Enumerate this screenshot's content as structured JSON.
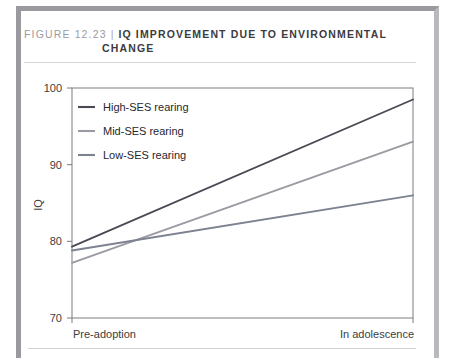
{
  "figure": {
    "number": "FIGURE 12.23",
    "separator": "|",
    "title_line1": "IQ IMPROVEMENT DUE TO ENVIRONMENTAL",
    "title_line2": "CHANGE"
  },
  "chart_data": {
    "type": "line",
    "title": "IQ IMPROVEMENT DUE TO ENVIRONMENTAL CHANGE",
    "xlabel": "",
    "ylabel": "IQ",
    "x": [
      "Pre-adoption",
      "In adolescence"
    ],
    "categories": [
      "Pre-adoption",
      "In adolescence"
    ],
    "xtick_labels": [
      "Pre-adoption",
      "In adolescence"
    ],
    "ytick_labels": [
      "100",
      "90",
      "80",
      "70"
    ],
    "yticks": [
      100,
      90,
      80,
      70
    ],
    "ylim": [
      70,
      100
    ],
    "grid": false,
    "legend_position": "upper-left-inside",
    "series": [
      {
        "name": "High-SES rearing",
        "values": [
          79.3,
          98.5
        ],
        "color": "#4a4a55"
      },
      {
        "name": "Mid-SES rearing",
        "values": [
          77.2,
          93.0
        ],
        "color": "#9a9aa2"
      },
      {
        "name": "Low-SES rearing",
        "values": [
          78.8,
          86.0
        ],
        "color": "#7d8290"
      }
    ]
  },
  "legend": {
    "items": [
      {
        "label": "High-SES rearing"
      },
      {
        "label": "Mid-SES rearing"
      },
      {
        "label": "Low-SES rearing"
      }
    ]
  },
  "colors": {
    "frame": "#9a9a9e",
    "rule": "#d7d7da",
    "axis": "#7c7c80",
    "text": "#3c3c40",
    "figure_number": "#9c9ca0"
  }
}
